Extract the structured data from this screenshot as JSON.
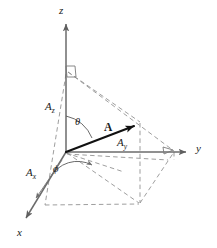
{
  "figure": {
    "width": 217,
    "height": 248,
    "background": "#ffffff",
    "line_color_solid": "#6b6b6b",
    "line_color_vector": "#111111",
    "line_color_dashed": "#8c8c8c",
    "text_color": "#1a1a1a"
  },
  "axes": [
    {
      "name": "z-axis",
      "label": "z",
      "direction": "up",
      "x": 62,
      "y": 9
    },
    {
      "name": "y-axis",
      "label": "y",
      "direction": "right",
      "x": 196,
      "y": 148
    },
    {
      "name": "x-axis",
      "label": "x",
      "direction": "down-left",
      "x": 16,
      "y": 228
    }
  ],
  "origin": {
    "x": 66,
    "y": 152
  },
  "vector": {
    "label": "A",
    "label_x": 107,
    "label_y": 128,
    "tip_x": 140,
    "tip_y": 122
  },
  "components": [
    {
      "name": "z-component",
      "label": "A",
      "sub": "z",
      "x": 46,
      "y": 103
    },
    {
      "name": "y-component",
      "label": "A",
      "sub": "y",
      "x": 118,
      "y": 139
    },
    {
      "name": "x-component",
      "label": "A",
      "sub": "x",
      "x": 28,
      "y": 168
    }
  ],
  "angles": [
    {
      "name": "theta-angle",
      "label": "θ",
      "x": 76,
      "y": 122,
      "description": "polar angle from z-axis to vector A"
    },
    {
      "name": "phi-angle",
      "label": "ϕ",
      "x": 54,
      "y": 167,
      "description": "azimuthal angle from x-axis to projection in xy-plane"
    }
  ],
  "right_angle_markers": [
    {
      "name": "right-angle-z-axis",
      "x": 66,
      "y": 72
    },
    {
      "name": "right-angle-y-axis",
      "x": 172,
      "y": 152
    }
  ]
}
